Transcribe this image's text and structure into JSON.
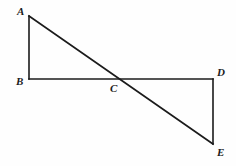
{
  "figure": {
    "background_color": "#fefefe",
    "stroke_color": "#1b1b1b",
    "stroke_width": 1.6,
    "label_color": "#1b1b1b",
    "points": {
      "A": {
        "name": "A",
        "x": 29,
        "y": 16
      },
      "B": {
        "name": "B",
        "x": 29,
        "y": 79
      },
      "C": {
        "name": "C",
        "x": 122,
        "y": 79
      },
      "D": {
        "name": "D",
        "x": 213,
        "y": 79
      },
      "E": {
        "name": "E",
        "x": 213,
        "y": 144
      }
    },
    "segments": [
      {
        "id": "AB",
        "name": "segment-ab",
        "from": "A",
        "to": "B"
      },
      {
        "id": "BD",
        "name": "segment-bd",
        "from": "B",
        "to": "D"
      },
      {
        "id": "AE",
        "name": "segment-ae",
        "from": "A",
        "to": "E"
      },
      {
        "id": "DE",
        "name": "segment-de",
        "from": "D",
        "to": "E"
      }
    ],
    "labels": [
      {
        "id": "A",
        "text": "A",
        "x": 17,
        "y": 6
      },
      {
        "id": "B",
        "text": "B",
        "x": 16,
        "y": 76
      },
      {
        "id": "C",
        "text": "C",
        "x": 110,
        "y": 83
      },
      {
        "id": "D",
        "text": "D",
        "x": 217,
        "y": 67
      },
      {
        "id": "E",
        "text": "E",
        "x": 217,
        "y": 147
      }
    ]
  }
}
